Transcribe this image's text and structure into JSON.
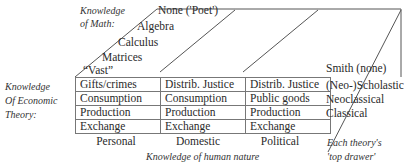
{
  "math_axis": {
    "label_line1": "Knowledge",
    "label_line2": "of Math:",
    "levels": [
      "None ('Poet')",
      "Algebra",
      "Calculus",
      "Matrices",
      "“Vast”"
    ]
  },
  "economic_axis": {
    "label_line1": "Knowledge",
    "label_line2": "Of Economic",
    "label_line3": "Theory:"
  },
  "human_nature_axis": {
    "label": "Knowledge of human nature",
    "columns": [
      "Personal",
      "Domestic",
      "Political"
    ]
  },
  "grid": {
    "rows": [
      [
        "Gifts/crimes",
        "Distrib. Justice",
        "Distrib. Justice"
      ],
      [
        "Consumption",
        "Consumption",
        "Public goods"
      ],
      [
        "Production",
        "Production",
        "Production"
      ],
      [
        "Exchange",
        "Exchange",
        "Exchange"
      ]
    ]
  },
  "top_drawer": {
    "smith": "Smith (none)",
    "theories": [
      "(Neo-)Scholastic",
      "Neoclassical",
      "Classical"
    ],
    "caption_line1": "Each theory's",
    "caption_line2": "'top drawer'"
  },
  "colors": {
    "line": "#555555",
    "text": "#2a2a2a"
  }
}
